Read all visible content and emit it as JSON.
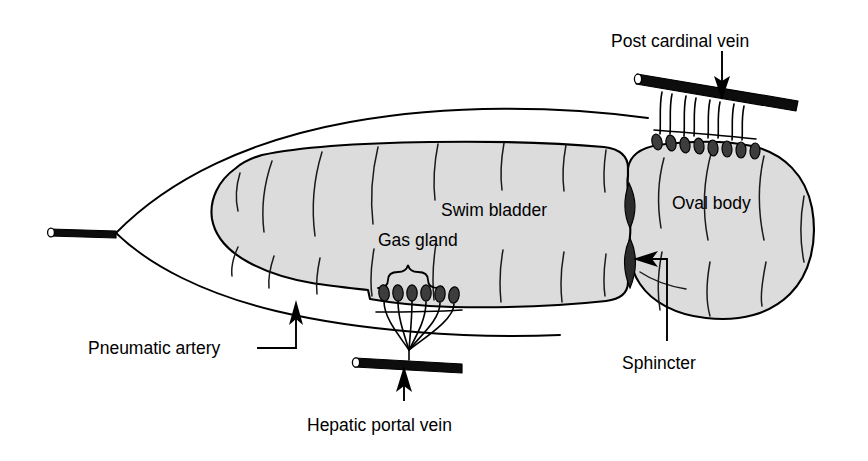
{
  "figure": {
    "background_color": "#ffffff",
    "organ_fill_color": "#dcdcdc",
    "ink_color": "#000000",
    "vessel_color": "#0d0d0d",
    "gland_cell_color": "#3d3d3d",
    "width": 868,
    "height": 461
  },
  "labels": {
    "post_cardinal_vein": "Post cardinal vein",
    "swim_bladder": "Swim bladder",
    "gas_gland": "Gas gland",
    "oval_body": "Oval body",
    "pneumatic_artery": "Pneumatic artery",
    "hepatic_portal_vein": "Hepatic portal vein",
    "sphincter": "Sphincter"
  },
  "structures": [
    {
      "name": "swim-bladder-main-chamber",
      "label": "Swim bladder",
      "description": "Large elongate gas-filled chamber, light gray fill with muscular striation lines",
      "fill": "#dcdcdc"
    },
    {
      "name": "oval-body",
      "label": "Oval body",
      "description": "Rounded posterior resorptive chamber separated by a constricted waist",
      "fill": "#dcdcdc"
    },
    {
      "name": "gas-gland",
      "label": "Gas gland",
      "description": "Six dark secretory cells on the ventral wall beneath a brace, drained by a rete mirabile",
      "cell_count": 6
    },
    {
      "name": "oval-body-capillary-bed",
      "label": "Post cardinal vein capillaries",
      "description": "Eight dark cells with paired capillaries ascending to the post cardinal vein",
      "cell_count": 8
    },
    {
      "name": "sphincter",
      "label": "Sphincter",
      "description": "Two dark lens-shaped muscular valves at the waist between chamber and oval body",
      "count": 2
    },
    {
      "name": "pneumatic-artery",
      "label": "Pneumatic artery",
      "description": "Thick black vessel entering at the anterior apex of the outer membrane"
    },
    {
      "name": "hepatic-portal-vein",
      "label": "Hepatic portal vein",
      "description": "Thick black vessel below the gas gland receiving the rete mirabile"
    },
    {
      "name": "post-cardinal-vein",
      "label": "Post cardinal vein",
      "description": "Thick black vessel above the oval body receiving its capillary bed"
    },
    {
      "name": "outer-membrane",
      "label": "Outer membrane",
      "description": "Thin pointed envelope enclosing the bladder, converging anteriorly at the artery"
    }
  ],
  "annotations": [
    {
      "name": "post-cardinal-vein-arrow",
      "points_to": "post-cardinal-vein",
      "direction": "down"
    },
    {
      "name": "hepatic-portal-vein-arrow",
      "points_to": "hepatic-portal-vein",
      "direction": "up"
    },
    {
      "name": "pneumatic-artery-arrow",
      "points_to": "outer-membrane",
      "direction": "up",
      "leader": "elbow"
    },
    {
      "name": "sphincter-arrow",
      "points_to": "sphincter",
      "direction": "left",
      "leader": "elbow"
    },
    {
      "name": "gas-gland-brace",
      "points_to": "gas-gland",
      "shape": "curly-brace"
    }
  ]
}
